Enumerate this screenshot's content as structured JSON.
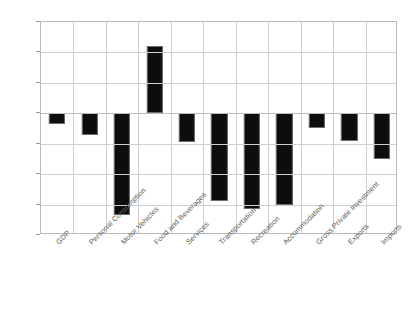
{
  "chart_data": {
    "type": "bar",
    "title": "",
    "subtitle": "",
    "xlabel": "",
    "ylabel": "",
    "categories": [
      "GDP",
      "Personal Consumption",
      "Motor Vehicles",
      "Food and Beverages",
      "Services",
      "Transportation",
      "Recreation",
      "Accommodation",
      "Gross Private Investment",
      "Exports",
      "Imports"
    ],
    "values": [
      -3.5,
      -7,
      -33.5,
      22,
      -9.5,
      -28.7,
      -31.6,
      -30,
      -5,
      -9,
      -15
    ],
    "ylim": [
      -40,
      30
    ],
    "yticks": [
      30,
      20,
      10,
      0,
      -10,
      -20,
      -30,
      -40
    ],
    "ytick_labels": [
      "30",
      "20",
      "10",
      "0",
      "-10",
      "-20",
      "-30",
      "-40"
    ],
    "grid": "horizontal-and-vertical",
    "legend": "none",
    "bar_color": "#0d0d0d",
    "grid_color": "#cfcfcf",
    "axis_color": "#b9b9b9",
    "label_color": "#5d5d5d"
  }
}
